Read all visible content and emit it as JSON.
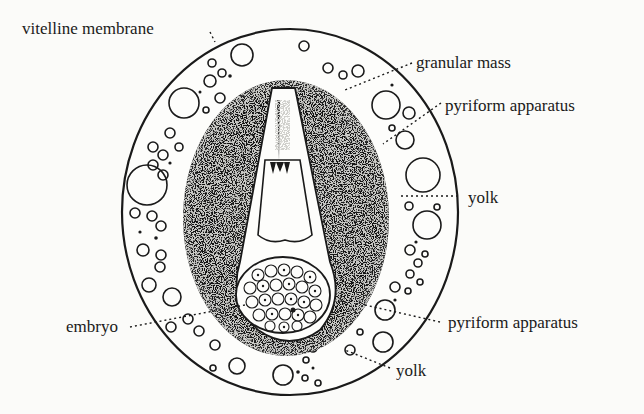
{
  "figure": {
    "colors": {
      "ink": "#1a1a1a",
      "paper": "#fbfbf9"
    },
    "labels": [
      {
        "id": "vitelline-membrane",
        "text": "vitelline membrane"
      },
      {
        "id": "granular-mass",
        "text": "granular mass"
      },
      {
        "id": "pyriform-apparatus-upper",
        "text": "pyriform apparatus"
      },
      {
        "id": "yolk-right",
        "text": "yolk"
      },
      {
        "id": "embryo",
        "text": "embryo"
      },
      {
        "id": "pyriform-apparatus-lower",
        "text": "pyriform apparatus"
      },
      {
        "id": "yolk-bottom",
        "text": "yolk"
      }
    ]
  }
}
